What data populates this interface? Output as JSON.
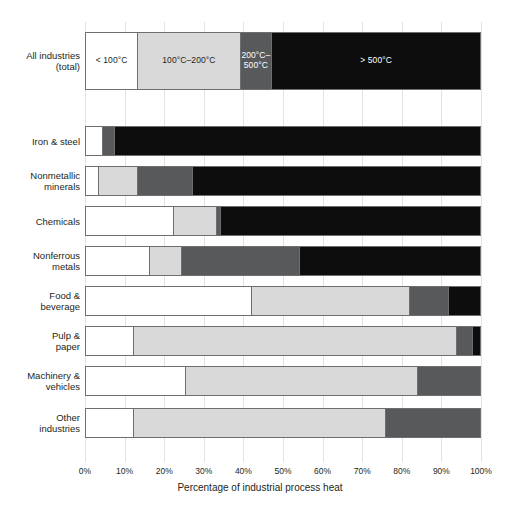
{
  "chart_data": {
    "type": "bar",
    "orientation": "horizontal",
    "stacked": true,
    "stack_mode": "percent",
    "title": "",
    "xlabel": "Percentage of industrial process heat",
    "ylabel": "",
    "xlim": [
      0,
      100
    ],
    "xticks": [
      0,
      10,
      20,
      30,
      40,
      50,
      60,
      70,
      80,
      90,
      100
    ],
    "xtick_labels": [
      "0%",
      "10%",
      "20%",
      "30%",
      "40%",
      "50%",
      "60%",
      "70%",
      "80%",
      "90%",
      "100%"
    ],
    "grid": "vertical",
    "legend_position": "in-bar-first-row",
    "categories": [
      "All industries\n(total)",
      "Iron & steel",
      "Nonmetallic\nminerals",
      "Chemicals",
      "Nonferrous\nmetals",
      "Food &\nbeverage",
      "Pulp &\npaper",
      "Machinery &\nvehicles",
      "Other\nindustries"
    ],
    "series": [
      {
        "name": "< 100°C",
        "color": "#ffffff",
        "values": [
          13,
          4,
          3,
          22,
          16,
          42,
          12,
          25,
          12
        ]
      },
      {
        "name": "100°C–200°C",
        "color": "#d9d9d9",
        "values": [
          26,
          0,
          10,
          11,
          8,
          40,
          82,
          59,
          64
        ]
      },
      {
        "name": "200°C–\n500°C",
        "color": "#58595b",
        "values": [
          8,
          3,
          14,
          1,
          30,
          10,
          4,
          16,
          24
        ]
      },
      {
        "name": "> 500°C",
        "color": "#0d0d0d",
        "values": [
          53,
          93,
          73,
          66,
          46,
          8,
          2,
          0,
          0
        ]
      }
    ],
    "bar_labels_row0": [
      "< 100°C",
      "100°C–200°C",
      "200°C–\n500°C",
      "> 500°C"
    ]
  },
  "axis": {
    "title": "Percentage of industrial process heat"
  },
  "caption": {
    "text": ""
  }
}
